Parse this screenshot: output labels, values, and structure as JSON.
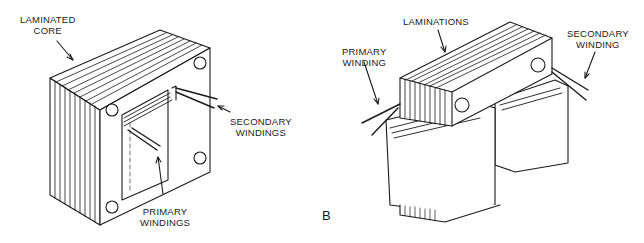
{
  "figure_a": {
    "labels": {
      "laminated_core": [
        "LAMINATED",
        "CORE"
      ],
      "secondary_windings": [
        "SECONDARY",
        "WINDINGS"
      ],
      "primary_windings": [
        "PRIMARY",
        "WINDINGS"
      ]
    }
  },
  "figure_b": {
    "panel_label": "B",
    "labels": {
      "laminations": "LAMINATIONS",
      "primary_winding": [
        "PRIMARY",
        "WINDING"
      ],
      "secondary_winding": [
        "SECONDARY",
        "WINDING"
      ]
    }
  },
  "colors": {
    "stroke": "#1a1a1a",
    "background": "#ffffff"
  }
}
